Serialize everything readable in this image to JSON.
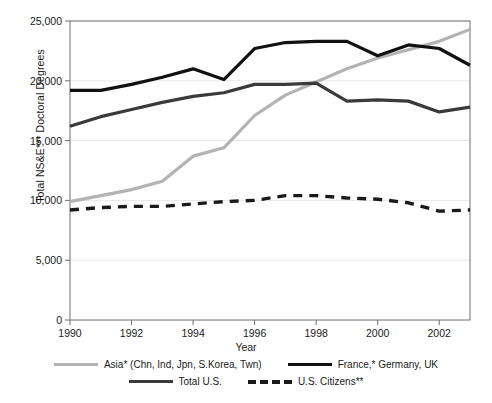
{
  "chart_data": {
    "type": "line",
    "title": "",
    "xlabel": "Year",
    "ylabel": "Total NS&E*** Doctoral Degrees",
    "x": [
      1990,
      1991,
      1992,
      1993,
      1994,
      1995,
      1996,
      1997,
      1998,
      1999,
      2000,
      2001,
      2002,
      2003
    ],
    "xlim": [
      1990,
      2003
    ],
    "ylim": [
      0,
      25000
    ],
    "xticks": [
      1990,
      1992,
      1994,
      1996,
      1998,
      2000,
      2002
    ],
    "xtick_labels": [
      "1990",
      "1992",
      "1994",
      "1996",
      "1998",
      "2000",
      "2002"
    ],
    "yticks": [
      0,
      5000,
      10000,
      15000,
      20000,
      25000
    ],
    "ytick_labels": [
      "0",
      "5,000",
      "10,000",
      "15,000",
      "20,000",
      "25,000"
    ],
    "grid": "horizontal",
    "legend_position": "below",
    "series": [
      {
        "name": "Asia* (Chn, Ind, Jpn, S.Korea, Twn)",
        "color": "#b3b3b3",
        "style": "solid",
        "width": 3.2,
        "values": [
          9900,
          10400,
          10900,
          11600,
          13700,
          14400,
          17100,
          18800,
          19900,
          21000,
          21900,
          22600,
          23300,
          24300
        ]
      },
      {
        "name": "France,* Germany, UK",
        "color": "#111111",
        "style": "solid",
        "width": 3.2,
        "values": [
          19200,
          19200,
          19700,
          20300,
          21000,
          20100,
          22700,
          23200,
          23300,
          23300,
          22100,
          23000,
          22700,
          21300
        ]
      },
      {
        "name": "Total U.S.",
        "color": "#3a3a3a",
        "style": "solid",
        "width": 3.2,
        "values": [
          16200,
          17000,
          17600,
          18200,
          18700,
          19000,
          19700,
          19700,
          19800,
          18300,
          18400,
          18300,
          17400,
          17800
        ]
      },
      {
        "name": "U.S. Citizens**",
        "color": "#1a1a1a",
        "style": "dashed",
        "width": 3.4,
        "values": [
          9200,
          9400,
          9500,
          9500,
          9700,
          9900,
          10000,
          10400,
          10400,
          10200,
          10100,
          9800,
          9100,
          9200
        ]
      }
    ]
  },
  "axes": {
    "y_title": "Total NS&E*** Doctoral Degrees",
    "x_title": "Year"
  },
  "legend": {
    "row1": [
      {
        "label": "Asia* (Chn, Ind, Jpn, S.Korea, Twn)",
        "color": "#b3b3b3",
        "style": "solid"
      },
      {
        "label": "France,* Germany, UK",
        "color": "#111111",
        "style": "solid"
      }
    ],
    "row2": [
      {
        "label": "Total U.S.",
        "color": "#3a3a3a",
        "style": "solid"
      },
      {
        "label": "U.S. Citizens**",
        "color": "#1a1a1a",
        "style": "dashed"
      }
    ]
  }
}
